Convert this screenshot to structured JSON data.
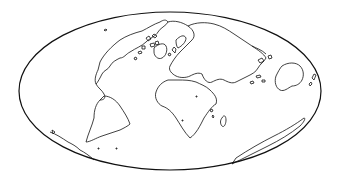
{
  "map": {
    "projection": "mollweide-oblique",
    "style": "coastline-outline",
    "frame": {
      "cx": 170,
      "cy": 91,
      "rx": 151,
      "ry": 79
    },
    "colors": {
      "background": "#ffffff",
      "line": "#111111"
    },
    "features": [
      "north-america",
      "greenland",
      "arctic-archipelago",
      "south-america",
      "europe",
      "africa",
      "madagascar",
      "asia",
      "australia",
      "antarctica"
    ]
  }
}
